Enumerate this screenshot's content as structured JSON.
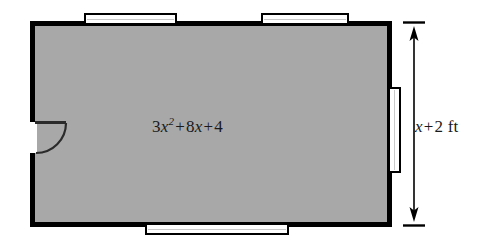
{
  "figure": {
    "background_color": "#ffffff",
    "floor_fill_color": "#a8a8a8",
    "wall_color": "#000000",
    "opening_fill_color": "#ffffff",
    "text_color": "#1a1a1a"
  },
  "room": {
    "area_expression": {
      "full_text": "3x^2 + 8x + 4",
      "coefficient_quadratic": "3",
      "variable": "x",
      "exponent": "2",
      "plus_1": "+",
      "coefficient_linear": "8",
      "variable_2": "x",
      "plus_2": "+",
      "constant": "4"
    },
    "height_label": {
      "full_text": "x + 2 ft",
      "variable": "x",
      "operator": "+",
      "constant": "2",
      "unit": "ft"
    }
  },
  "features": {
    "windows": [
      {
        "name": "top-window-left",
        "wall": "top"
      },
      {
        "name": "top-window-right",
        "wall": "top"
      },
      {
        "name": "right-window",
        "wall": "right"
      },
      {
        "name": "bottom-window",
        "wall": "bottom"
      }
    ],
    "doors": [
      {
        "name": "left-door",
        "wall": "left",
        "swing": "inward"
      }
    ]
  },
  "dimension": {
    "orientation": "vertical",
    "arrowheads": "both",
    "measures": "room height"
  }
}
